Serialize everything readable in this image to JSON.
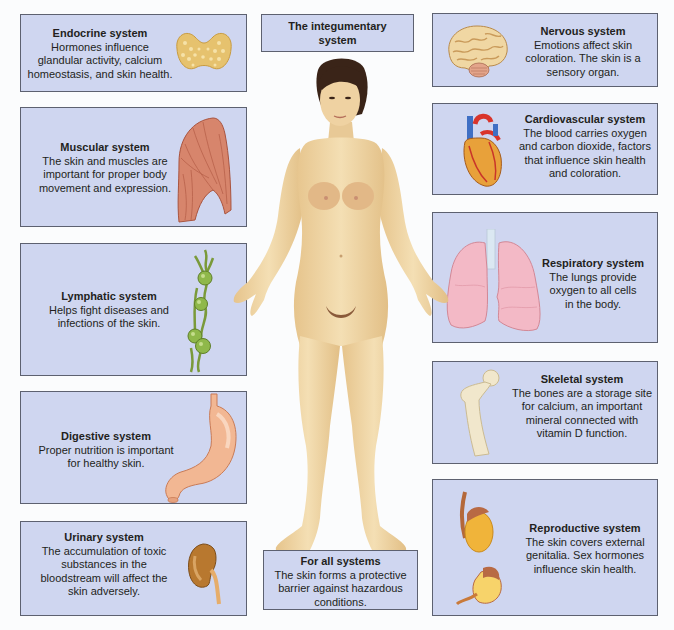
{
  "title": {
    "line1": "The integumentary",
    "line2": "system"
  },
  "panels": {
    "endocrine": {
      "title": "Endocrine system",
      "lines": [
        "Hormones influence",
        "glandular activity, calcium",
        "homeostasis, and skin health."
      ],
      "icon": "thyroid-gland-icon"
    },
    "muscular": {
      "title": "Muscular system",
      "lines": [
        "The skin and muscles are",
        "important for proper body",
        "movement and expression."
      ],
      "icon": "muscle-icon"
    },
    "lymphatic": {
      "title": "Lymphatic system",
      "lines": [
        "Helps fight diseases and",
        "infections of the skin."
      ],
      "icon": "lymph-nodes-icon"
    },
    "digestive": {
      "title": "Digestive system",
      "lines": [
        "Proper nutrition is important",
        "for healthy skin."
      ],
      "icon": "stomach-icon"
    },
    "urinary": {
      "title": "Urinary system",
      "lines": [
        "The accumulation of toxic",
        "substances in the",
        "bloodstream will affect the",
        "skin adversely."
      ],
      "icon": "kidney-icon"
    },
    "nervous": {
      "title": "Nervous system",
      "lines": [
        "Emotions affect skin",
        "coloration. The skin is a",
        "sensory organ."
      ],
      "icon": "brain-icon"
    },
    "cardiovascular": {
      "title": "Cardiovascular system",
      "lines": [
        "The blood carries oxygen",
        "and carbon dioxide, factors",
        "that influence skin health",
        "and coloration."
      ],
      "icon": "heart-icon"
    },
    "respiratory": {
      "title": "Respiratory system",
      "lines": [
        "The lungs provide",
        "oxygen to all cells",
        "in the body."
      ],
      "icon": "lungs-icon"
    },
    "skeletal": {
      "title": "Skeletal system",
      "lines": [
        "The bones are a storage site",
        "for calcium, an important",
        "mineral connected with",
        "vitamin D function."
      ],
      "icon": "femur-bone-icon"
    },
    "reproductive": {
      "title": "Reproductive system",
      "lines": [
        "The skin covers external",
        "genitalia. Sex hormones",
        "influence skin health."
      ],
      "icon": "gonads-icon"
    },
    "all": {
      "title": "For all systems",
      "lines": [
        "The skin forms a protective",
        "barrier against hazardous",
        "conditions."
      ]
    }
  },
  "colors": {
    "panel_bg": "#cfd6f0",
    "panel_border": "#5d6170",
    "skin": "#f1d9a8",
    "hair": "#3a2418"
  }
}
